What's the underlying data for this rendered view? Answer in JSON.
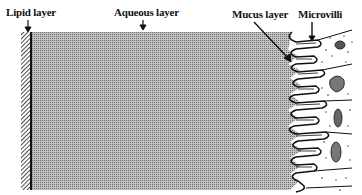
{
  "figure": {
    "labels": {
      "lipid": "Lipid layer",
      "aqueous": "Aqueous layer",
      "mucus": "Mucus layer",
      "microvilli": "Microvilli"
    },
    "colors": {
      "ink": "#111111",
      "aqueous_fill": "#9a9a9a",
      "background": "#ffffff"
    }
  }
}
